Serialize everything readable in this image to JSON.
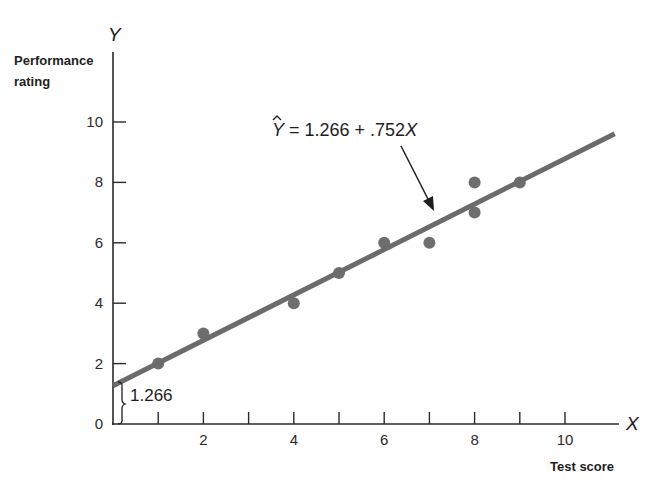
{
  "chart_data": {
    "type": "scatter",
    "title": "",
    "xlabel": "Test score",
    "ylabel": "Performance rating",
    "x_axis_symbol": "X",
    "y_axis_symbol": "Y",
    "xlim": [
      0,
      11.2
    ],
    "ylim": [
      0,
      12.3
    ],
    "x_ticks": [
      1,
      2,
      3,
      4,
      5,
      6,
      7,
      8,
      9,
      10
    ],
    "x_tick_labels": [
      "",
      "2",
      "",
      "4",
      "",
      "6",
      "",
      "8",
      "",
      "10"
    ],
    "y_ticks": [
      0,
      2,
      4,
      6,
      8,
      10
    ],
    "y_tick_labels": [
      "0",
      "2",
      "4",
      "6",
      "8",
      "10"
    ],
    "grid": false,
    "legend": null,
    "series": [
      {
        "name": "observations",
        "type": "scatter",
        "points": [
          {
            "x": 1,
            "y": 2
          },
          {
            "x": 2,
            "y": 3
          },
          {
            "x": 4,
            "y": 4
          },
          {
            "x": 5,
            "y": 5
          },
          {
            "x": 6,
            "y": 6
          },
          {
            "x": 7,
            "y": 6
          },
          {
            "x": 8,
            "y": 8
          },
          {
            "x": 8,
            "y": 7
          },
          {
            "x": 9,
            "y": 8
          }
        ]
      },
      {
        "name": "regression line",
        "type": "line",
        "intercept": 1.266,
        "slope": 0.752,
        "x_range": [
          0,
          11.1
        ]
      }
    ],
    "annotations": [
      {
        "text": "Ŷ = 1.266 + .752X",
        "role": "regression-equation",
        "arrow_to": {
          "x": 7.1,
          "y": 7.1
        }
      },
      {
        "text": "1.266",
        "role": "intercept-label",
        "bracket": {
          "from": 0,
          "to": 1.266
        }
      }
    ]
  },
  "labels": {
    "y_symbol": "Y",
    "x_symbol": "X",
    "y_title_line1": "Performance",
    "y_title_line2": "rating",
    "x_title": "Test score",
    "equation_hat": "Y",
    "equation_rest": " = 1.266 + .752",
    "equation_x": "X",
    "intercept": "1.266"
  },
  "colors": {
    "axis": "#2a2a2a",
    "line": "#6b6b6b",
    "points": "#6e6e6e",
    "text": "#1e1e1e",
    "background": "#ffffff"
  }
}
